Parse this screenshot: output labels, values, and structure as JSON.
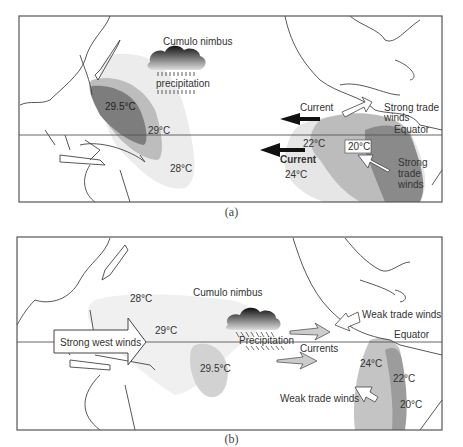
{
  "panel_a": {
    "caption": "(a)",
    "labels": {
      "cloud": "Cumulo nimbus",
      "precip": "precipitation",
      "t_warm_core": "29.5°C",
      "t_29": "29°C",
      "t_28": "28°C",
      "current_top": "Current",
      "current_bottom": "Current",
      "strong_trade_1": "Strong trade",
      "strong_trade_1b": "winds",
      "equator": "Equator",
      "t_22": "22°C",
      "t_20": "20°C",
      "t_24": "24°C",
      "strong_trade_2a": "Strong",
      "strong_trade_2b": "trade",
      "strong_trade_2c": "winds"
    }
  },
  "panel_b": {
    "caption": "(b)",
    "labels": {
      "t_28": "28°C",
      "cloud": "Cumulo nimbus",
      "west_winds": "Strong west winds",
      "t_29": "29°C",
      "precip": "Precipitation",
      "currents": "Currents",
      "t_warm_core": "29.5°C",
      "weak_trade_1": "Weak trade winds",
      "equator": "Equator",
      "t_24": "24°C",
      "t_22": "22°C",
      "t_20": "20°C",
      "weak_trade_2": "Weak trade winds"
    }
  },
  "colors": {
    "frame": "#555555",
    "coast": "#444444",
    "warm_light": "#ececec",
    "warm_mid": "#bdbdbd",
    "warm_dark": "#7d7d7d",
    "cold_light": "#e6e6e6",
    "cold_mid": "#bcbcbc",
    "cold_dark": "#8a8a8a"
  }
}
